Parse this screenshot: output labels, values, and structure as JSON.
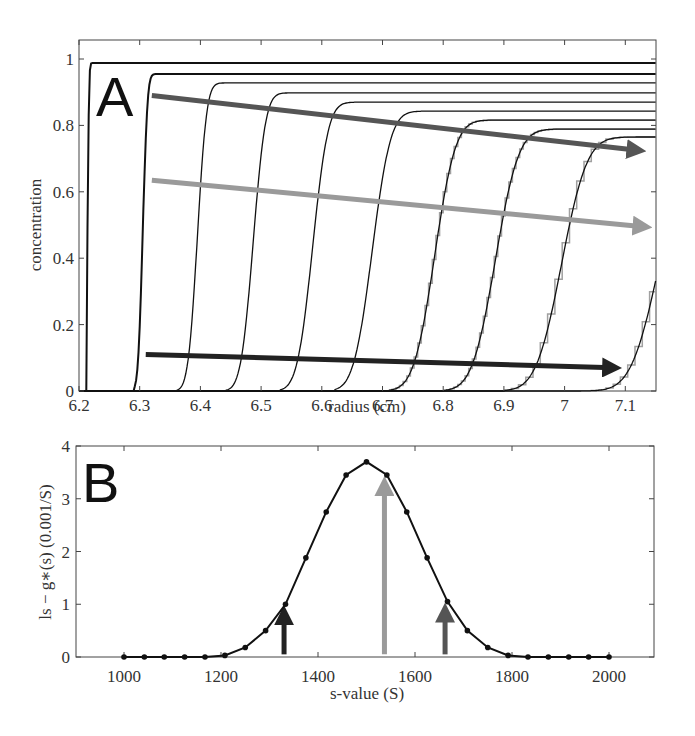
{
  "chart_data": [
    {
      "panel": "A",
      "type": "line",
      "title": "",
      "xlabel": "radius (cm)",
      "ylabel": "concentration",
      "xlim": [
        6.2,
        7.15
      ],
      "ylim": [
        0,
        1.05
      ],
      "xticks": [
        6.2,
        6.3,
        6.4,
        6.5,
        6.6,
        6.7,
        6.8,
        6.9,
        7,
        7.1
      ],
      "xtick_labels": [
        "6.2",
        "6.3",
        "6.4",
        "6.5",
        "6.6",
        "6.7",
        "6.8",
        "6.9",
        "7",
        "7.1"
      ],
      "yticks": [
        0,
        0.2,
        0.4,
        0.6,
        0.8,
        1
      ],
      "ytick_labels": [
        "0",
        "0.2",
        "0.4",
        "0.6",
        "0.8",
        "1"
      ],
      "grid": false,
      "series": [
        {
          "name": "scan 1",
          "boundary_midpoint": 6.214,
          "width": 0.002,
          "plateau": 0.988,
          "start": 6.213
        },
        {
          "name": "scan 2",
          "boundary_midpoint": 6.305,
          "width": 0.006,
          "plateau": 0.955,
          "start": 6.29
        },
        {
          "name": "scan 3",
          "boundary_midpoint": 6.395,
          "width": 0.012,
          "plateau": 0.928,
          "start": 6.36
        },
        {
          "name": "scan 4",
          "boundary_midpoint": 6.487,
          "width": 0.016,
          "plateau": 0.898,
          "start": 6.44
        },
        {
          "name": "scan 5",
          "boundary_midpoint": 6.585,
          "width": 0.02,
          "plateau": 0.87,
          "start": 6.53
        },
        {
          "name": "scan 6",
          "boundary_midpoint": 6.683,
          "width": 0.024,
          "plateau": 0.843,
          "start": 6.62
        },
        {
          "name": "scan 7",
          "boundary_midpoint": 6.786,
          "width": 0.027,
          "plateau": 0.816,
          "start": 6.71
        },
        {
          "name": "scan 8",
          "boundary_midpoint": 6.886,
          "width": 0.03,
          "plateau": 0.789,
          "start": 6.8
        },
        {
          "name": "scan 9",
          "boundary_midpoint": 6.995,
          "width": 0.033,
          "plateau": 0.765,
          "start": 6.9
        },
        {
          "name": "scan 10",
          "boundary_midpoint": 7.155,
          "width": 0.036,
          "plateau": 0.745,
          "start": 7.02
        }
      ],
      "annotations": [
        {
          "type": "arrow",
          "color": "#555555",
          "from": [
            6.32,
            0.89
          ],
          "to": [
            7.12,
            0.725
          ]
        },
        {
          "type": "arrow",
          "color": "#9a9a9a",
          "from": [
            6.32,
            0.635
          ],
          "to": [
            7.13,
            0.495
          ]
        },
        {
          "type": "arrow",
          "color": "#222222",
          "from": [
            6.31,
            0.11
          ],
          "to": [
            7.08,
            0.07
          ]
        },
        {
          "type": "text",
          "text": "A"
        }
      ]
    },
    {
      "panel": "B",
      "type": "line",
      "title": "",
      "xlabel": "s-value (S)",
      "ylabel": "ls − g∗(s) (0.001/S)",
      "xlim": [
        900,
        2100
      ],
      "ylim": [
        0,
        4
      ],
      "xticks": [
        1000,
        1200,
        1400,
        1600,
        1800,
        2000
      ],
      "xtick_labels": [
        "1000",
        "1200",
        "1400",
        "1600",
        "1800",
        "2000"
      ],
      "yticks": [
        0,
        1,
        2,
        3,
        4
      ],
      "ytick_labels": [
        "0",
        "1",
        "2",
        "3",
        "4"
      ],
      "grid": false,
      "x": [
        1000,
        1042,
        1083,
        1125,
        1167,
        1208,
        1250,
        1292,
        1333,
        1375,
        1417,
        1458,
        1500,
        1542,
        1583,
        1625,
        1667,
        1708,
        1750,
        1792,
        1833,
        1875,
        1917,
        1958,
        2000
      ],
      "series": [
        {
          "name": "ls-g*(s)",
          "values": [
            0,
            0,
            0,
            0,
            0,
            0.03,
            0.18,
            0.5,
            1.0,
            1.88,
            2.75,
            3.45,
            3.7,
            3.45,
            2.75,
            1.88,
            1.05,
            0.5,
            0.18,
            0.03,
            0,
            0,
            0,
            0,
            0
          ]
        }
      ],
      "annotations": [
        {
          "type": "arrow",
          "color": "#222222",
          "x": 1330,
          "from_y": 0.05,
          "to_y": 1.0
        },
        {
          "type": "arrow",
          "color": "#9a9a9a",
          "x": 1537,
          "from_y": 0.05,
          "to_y": 3.45
        },
        {
          "type": "arrow",
          "color": "#555555",
          "x": 1662,
          "from_y": 0.05,
          "to_y": 1.05
        },
        {
          "type": "text",
          "text": "B"
        }
      ]
    }
  ],
  "panels": {
    "a": {
      "letter": "A",
      "xlabel": "radius (cm)",
      "ylabel": "concentration"
    },
    "b": {
      "letter": "B",
      "xlabel": "s-value (S)",
      "ylabel": "ls − g∗(s) (0.001/S)"
    }
  },
  "colors": {
    "arrow_dark": "#222222",
    "arrow_medium": "#555555",
    "arrow_light": "#9a9a9a",
    "step_gray": "#a0a0a0",
    "line": "#111111"
  }
}
